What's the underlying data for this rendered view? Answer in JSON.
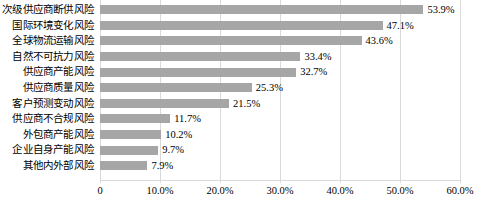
{
  "chart_data": {
    "type": "bar",
    "orientation": "horizontal",
    "title": "",
    "subtitle": "",
    "xlabel": "",
    "ylabel": "",
    "xlim": [
      0,
      60
    ],
    "grid": true,
    "legend": false,
    "legend_position": "none",
    "bar_color": "#a6a6a6",
    "gridline_color": "#d9d9d9",
    "value_suffix": "%",
    "categories": [
      "次级供应商断供风险",
      "国际环境变化风险",
      "全球物流运输风险",
      "自然不可抗力风险",
      "供应商产能风险",
      "供应商质量风险",
      "客户预测变动风险",
      "供应商不合规风险",
      "外包商产能风险",
      "企业自身产能风险",
      "其他内外部风险"
    ],
    "values": [
      53.9,
      47.1,
      43.6,
      33.4,
      32.7,
      25.3,
      21.5,
      11.7,
      10.2,
      9.7,
      7.9
    ],
    "data_labels": [
      "53.9%",
      "47.1%",
      "43.6%",
      "33.4%",
      "32.7%",
      "25.3%",
      "21.5%",
      "11.7%",
      "10.2%",
      "9.7%",
      "7.9%"
    ],
    "xticks": [
      0,
      10,
      20,
      30,
      40,
      50,
      60
    ],
    "xtick_labels": [
      "0",
      "10.0%",
      "20.0%",
      "30.0%",
      "40.0%",
      "50.0%",
      "60.0%"
    ]
  }
}
